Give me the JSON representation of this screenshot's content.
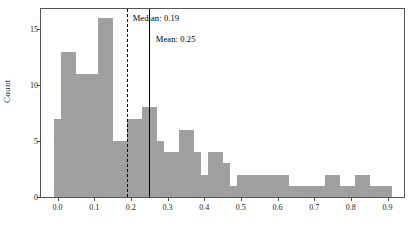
{
  "chart_data": {
    "type": "bar",
    "title": "",
    "subtitle": "",
    "xlabel": "",
    "ylabel": "Count",
    "xlim": [
      -0.045,
      0.945
    ],
    "ylim": [
      0,
      16.8
    ],
    "grid": false,
    "legend": null,
    "bin_width": 0.02,
    "bar_color": "#a0a0a0",
    "x_ticks": [
      0.0,
      0.1,
      0.2,
      0.3,
      0.4,
      0.5,
      0.6,
      0.7,
      0.8,
      0.9
    ],
    "x_tick_labels": [
      "0.0",
      "0.1",
      "0.2",
      "0.3",
      "0.4",
      "0.5",
      "0.6",
      "0.7",
      "0.8",
      "0.9"
    ],
    "y_ticks": [
      0,
      5,
      10,
      15
    ],
    "y_tick_labels": [
      "0",
      "5",
      "10",
      "15"
    ],
    "bin_starts": [
      -0.01,
      0.01,
      0.03,
      0.05,
      0.07,
      0.09,
      0.11,
      0.13,
      0.15,
      0.17,
      0.19,
      0.21,
      0.23,
      0.25,
      0.27,
      0.29,
      0.31,
      0.33,
      0.35,
      0.37,
      0.39,
      0.41,
      0.43,
      0.45,
      0.47,
      0.49,
      0.51,
      0.53,
      0.55,
      0.57,
      0.59,
      0.61,
      0.63,
      0.65,
      0.67,
      0.69,
      0.71,
      0.73,
      0.75,
      0.77,
      0.79,
      0.81,
      0.83,
      0.85,
      0.87,
      0.89
    ],
    "values": [
      7,
      13,
      13,
      11,
      11,
      11,
      16,
      16,
      5,
      5,
      7,
      7,
      8,
      8,
      5,
      4,
      4,
      6,
      6,
      4,
      2,
      4,
      4,
      3,
      1,
      2,
      2,
      2,
      2,
      2,
      2,
      2,
      1,
      1,
      1,
      1,
      1,
      2,
      2,
      1,
      1,
      2,
      2,
      1,
      1,
      1
    ],
    "annotations": [
      {
        "name": "median",
        "label": "Median: 0.19",
        "value": 0.19,
        "line_style": "dashed",
        "color": "#000000",
        "label_x": 0.205,
        "label_y": 16.4
      },
      {
        "name": "mean",
        "label": "Mean: 0.25",
        "value": 0.25,
        "line_style": "solid",
        "color": "#000000",
        "label_x": 0.268,
        "label_y": 14.6
      }
    ]
  }
}
